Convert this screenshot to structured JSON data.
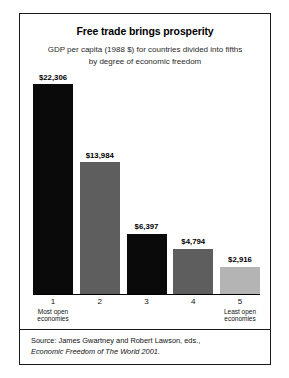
{
  "chart_data": {
    "type": "bar",
    "title": "Free trade brings prosperity",
    "subtitle_line1": "GDP per capita (1988 $) for countries divided into fifths",
    "subtitle_line2": "by degree of economic freedom",
    "xlabel": "",
    "ylabel": "",
    "ylim": [
      0,
      24000
    ],
    "grid": false,
    "legend": "none",
    "categories": [
      "1",
      "2",
      "3",
      "4",
      "5"
    ],
    "category_sublabels": [
      "Most open economies",
      "",
      "",
      "",
      "Least open economies"
    ],
    "values": [
      22306,
      13984,
      6397,
      4794,
      2916
    ],
    "value_labels": [
      "$22,306",
      "$13,984",
      "$6,397",
      "$4,794",
      "$2,916"
    ],
    "bar_colors": [
      "#0a0a0a",
      "#5e5e5e",
      "#0a0a0a",
      "#5e5e5e",
      "#b4b4b4"
    ],
    "source_line1": "Source: James Gwartney and Robert Lawson, eds.,",
    "source_line2": "Economic Freedom of The World 2001."
  },
  "colors": {
    "frame": "#1a1a1a",
    "background": "#ffffff",
    "text": "#111111"
  }
}
